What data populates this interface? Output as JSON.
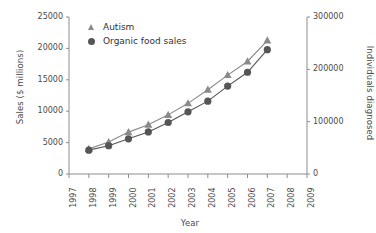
{
  "chart_data": {
    "type": "line",
    "title": "",
    "xlabel": "Year",
    "ylabel": "Sales ($ millions)",
    "y2label": "Individuals diagnosed",
    "x": [
      1998,
      1999,
      2000,
      2001,
      2002,
      2003,
      2004,
      2005,
      2006,
      2007
    ],
    "xlim": [
      1997,
      2009
    ],
    "xticks": [
      "1997",
      "1998",
      "1999",
      "2000",
      "2001",
      "2002",
      "2003",
      "2004",
      "2005",
      "2006",
      "2007",
      "2008",
      "2009"
    ],
    "ylim": [
      0,
      25000
    ],
    "yticks": [
      "0",
      "5000",
      "10000",
      "15000",
      "20000",
      "25000"
    ],
    "y2lim": [
      0,
      300000
    ],
    "y2ticks": [
      "0",
      "100000",
      "200000",
      "300000"
    ],
    "grid": false,
    "legend_position": "top-left",
    "series": [
      {
        "name": "Autism",
        "axis": "right",
        "marker": "triangle",
        "color": "#8a8a8a",
        "values": [
          48000,
          61000,
          80000,
          94000,
          113000,
          135000,
          161000,
          189000,
          215000,
          255000
        ]
      },
      {
        "name": "Organic food sales",
        "axis": "left",
        "marker": "circle",
        "color": "#555555",
        "values": [
          3800,
          4500,
          5600,
          6700,
          8200,
          9900,
          11600,
          14000,
          16200,
          19800
        ]
      }
    ]
  },
  "legend": {
    "items": [
      {
        "label": "Autism",
        "marker": "triangle-marker-icon"
      },
      {
        "label": "Organic food sales",
        "marker": "circle-marker-icon"
      }
    ]
  },
  "axes": {
    "x_title": "Year",
    "y_left_title": "Sales ($ millions)",
    "y_right_title": "Individuals diagnosed"
  }
}
